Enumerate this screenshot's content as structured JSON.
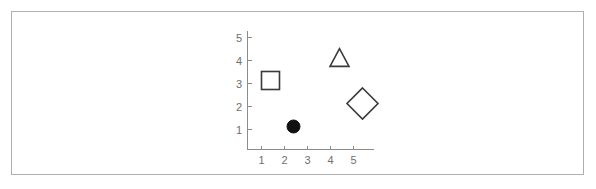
{
  "chart_data": {
    "type": "scatter",
    "title": "",
    "subtitle": "",
    "xlabel": "",
    "ylabel": "",
    "xlim": [
      0,
      5.8
    ],
    "ylim": [
      0,
      5.6
    ],
    "grid": false,
    "legend": "none",
    "x_ticks": [
      1,
      2,
      3,
      4,
      5
    ],
    "y_ticks": [
      1,
      2,
      3,
      4,
      5
    ],
    "x_tick_labels": [
      "1",
      "2",
      "3",
      "4",
      "5"
    ],
    "y_tick_labels": [
      "1",
      "2",
      "3",
      "4",
      "5"
    ],
    "points": [
      {
        "label": "square",
        "marker": "square",
        "fill": "open",
        "x": 1,
        "y": 3,
        "size": 18
      },
      {
        "label": "circle",
        "marker": "circle",
        "fill": "filled",
        "x": 2,
        "y": 1,
        "size": 13
      },
      {
        "label": "triangle",
        "marker": "triangle",
        "fill": "open",
        "x": 4,
        "y": 4,
        "size": 19
      },
      {
        "label": "diamond",
        "marker": "diamond",
        "fill": "open",
        "x": 5,
        "y": 2,
        "size": 31
      }
    ],
    "colors": {
      "axis": "#8c8c8c",
      "tick_label": "#6e6e6e",
      "marker_outline": "#3a3a3a",
      "marker_fill": "#111111",
      "frame_border": "#b0b0b0",
      "background": "#ffffff"
    }
  }
}
